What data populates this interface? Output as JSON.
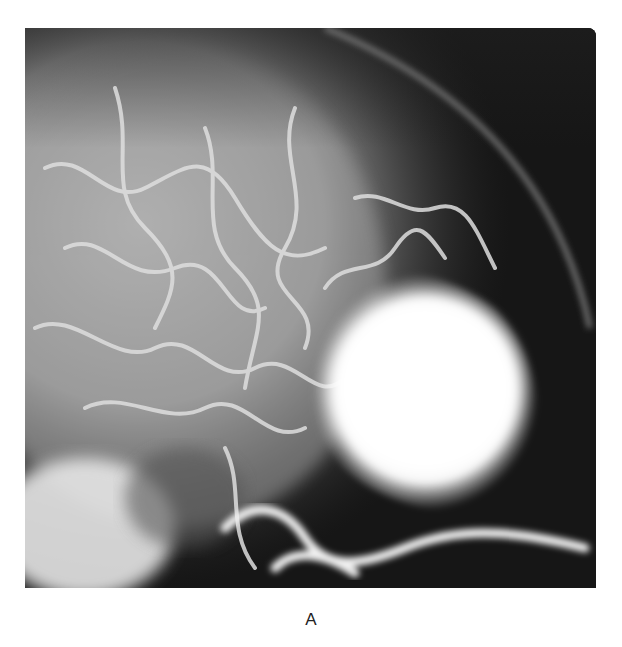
{
  "figure": {
    "label": "A",
    "colors": {
      "background": "#ffffff",
      "dark_region": "#111111",
      "mid_gray": "#8a8a8a",
      "vessel": "#dcdcdc",
      "mass": "#fafafa"
    }
  }
}
